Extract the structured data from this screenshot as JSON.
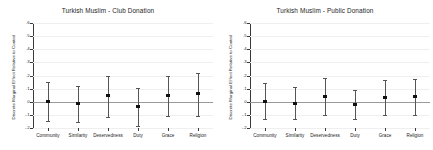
{
  "figure": {
    "background": "#ffffff",
    "marker_color": "#111111",
    "ci_color": "#555555",
    "grid_color": "#efefef",
    "zero_line_color": "#9a9a9a",
    "axis_color": "#3a3a3a"
  },
  "chart_data": [
    {
      "type": "scatter",
      "panel": "left",
      "title": "Turkish Muslim - Club Donation",
      "xlabel": "",
      "ylabel": "Discrete Marginal Effect Relative to Control",
      "categories": [
        "Community",
        "Similarity",
        "Deservedness",
        "Duty",
        "Grace",
        "Religion"
      ],
      "values": [
        0.005,
        -0.015,
        0.045,
        -0.035,
        0.045,
        0.065
      ],
      "ci_lower": [
        -0.145,
        -0.158,
        -0.115,
        -0.188,
        -0.112,
        -0.105
      ],
      "ci_upper": [
        0.152,
        0.122,
        0.2,
        0.105,
        0.198,
        0.222
      ],
      "ylim": [
        -0.2,
        0.6
      ],
      "yticks": [
        -0.2,
        -0.1,
        0,
        0.1,
        0.2,
        0.3,
        0.4,
        0.5,
        0.6
      ],
      "yticklabels": [
        "-.2",
        "-.1",
        "0",
        ".1",
        ".2",
        ".3",
        ".4",
        ".5",
        ".6"
      ],
      "grid": true,
      "zero_reference_line": 0,
      "legend": null
    },
    {
      "type": "scatter",
      "panel": "right",
      "title": "Turkish Muslim - Public Donation",
      "xlabel": "",
      "ylabel": "Discrete Marginal Effect Relative to Control",
      "categories": [
        "Community",
        "Similarity",
        "Deservedness",
        "Duty",
        "Grace",
        "Religion"
      ],
      "values": [
        0.005,
        -0.015,
        0.04,
        -0.018,
        0.03,
        0.04
      ],
      "ci_lower": [
        -0.128,
        -0.132,
        -0.098,
        -0.132,
        -0.098,
        -0.098
      ],
      "ci_upper": [
        0.142,
        0.112,
        0.178,
        0.088,
        0.165,
        0.172
      ],
      "ylim": [
        -0.2,
        0.6
      ],
      "yticks": [
        -0.2,
        -0.1,
        0,
        0.1,
        0.2,
        0.3,
        0.4,
        0.5,
        0.6
      ],
      "yticklabels": [
        "-.2",
        "-.1",
        "0",
        ".1",
        ".2",
        ".3",
        ".4",
        ".5",
        ".6"
      ],
      "grid": true,
      "zero_reference_line": 0,
      "legend": null
    }
  ]
}
